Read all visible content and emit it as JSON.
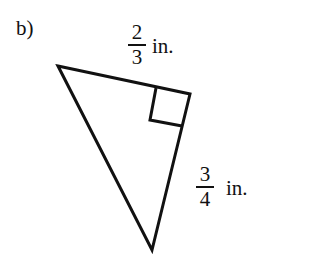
{
  "part_label": "b)",
  "triangle": {
    "vertices": [
      [
        58,
        66
      ],
      [
        190,
        94
      ],
      [
        152,
        250
      ]
    ],
    "right_angle_vertex": [
      190,
      94
    ],
    "right_angle_marker": [
      [
        156,
        88
      ],
      [
        150,
        120
      ],
      [
        182,
        126
      ]
    ],
    "stroke_color": "#111111"
  },
  "side_labels": [
    {
      "numerator": "2",
      "denominator": "3",
      "unit": "in."
    },
    {
      "numerator": "3",
      "denominator": "4",
      "unit": "in."
    }
  ]
}
